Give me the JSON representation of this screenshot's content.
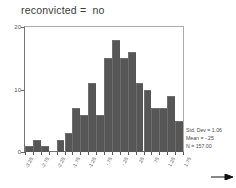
{
  "chart_data": {
    "type": "bar",
    "title": "reconvicted =  no",
    "xlabel": "",
    "ylabel": "",
    "ylim": [
      0,
      20
    ],
    "yticks": [
      0,
      10,
      20
    ],
    "ytick_labels": [
      "0",
      "10",
      "20"
    ],
    "grid": false,
    "legend": "none",
    "bin_width": 0.25,
    "categories": [
      "-3.25",
      "-3.00",
      "-2.75",
      "-2.50",
      "-2.25",
      "-2.00",
      "-1.75",
      "-1.50",
      "-1.25",
      "-1.00",
      "-.75",
      "-.50",
      "-.25",
      "0.00",
      ".25",
      ".50",
      ".75",
      "1.00",
      "1.25",
      "1.50"
    ],
    "values": [
      1,
      2,
      1,
      0,
      2,
      3,
      7,
      6,
      11,
      6,
      15,
      18,
      15,
      16,
      11,
      10,
      7,
      7,
      9,
      5
    ],
    "xtick_labels": [
      "-3.25",
      "-2.75",
      "-2.25",
      "-1.75",
      "-1.25",
      "-.75",
      "-.25",
      ".25",
      ".75",
      "1.25",
      "1.75"
    ],
    "annotations": [
      "Std. Dev = 1.06",
      "Mean = -.25",
      "N = 157.00"
    ],
    "bar_color": "#565656",
    "axis_color": "#777777",
    "text_color": "#4a4a4a"
  },
  "stats": {
    "std_dev": "Std. Dev = 1.06",
    "mean": "Mean = -.25",
    "n": "N = 157.00"
  }
}
